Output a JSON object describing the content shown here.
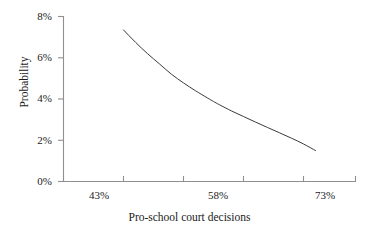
{
  "chart_data": {
    "type": "line",
    "title": "",
    "xlabel": "Pro-school court decisions",
    "ylabel": "Probability",
    "x_tick_labels": [
      "43%",
      "58%",
      "73%"
    ],
    "y_tick_labels": [
      "0%",
      "2%",
      "4%",
      "6%",
      "8%"
    ],
    "xlim": [
      40,
      78
    ],
    "ylim": [
      0,
      8
    ],
    "grid": false,
    "legend": null,
    "series": [
      {
        "name": "Probability",
        "x": [
          43,
          45,
          47,
          49,
          51,
          53,
          55,
          57,
          58,
          59,
          61,
          63,
          65,
          67,
          69,
          71,
          73,
          75
        ],
        "values": [
          7.35,
          6.75,
          6.2,
          5.7,
          5.2,
          4.78,
          4.4,
          4.05,
          3.88,
          3.72,
          3.42,
          3.15,
          2.88,
          2.62,
          2.36,
          2.1,
          1.82,
          1.5
        ],
        "line_color": "#3a3a3a",
        "line_width": 1.0
      }
    ],
    "axis_color": "#8f8f8f",
    "text_color": "#1a1a1a"
  },
  "axes": {
    "y_ticks": [
      {
        "label": "8%",
        "value": 8
      },
      {
        "label": "6%",
        "value": 6
      },
      {
        "label": "4%",
        "value": 4
      },
      {
        "label": "2%",
        "value": 2
      },
      {
        "label": "0%",
        "value": 0
      }
    ],
    "x_ticks": [
      {
        "label": "43%",
        "value": 43
      },
      {
        "label": "58%",
        "value": 58
      },
      {
        "label": "73%",
        "value": 73
      }
    ],
    "xlabel": "Pro-school court decisions",
    "ylabel": "Probability"
  }
}
